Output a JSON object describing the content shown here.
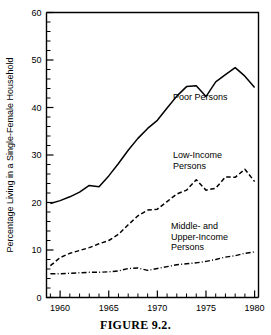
{
  "caption": "FIGURE 9.2.",
  "chart_data": {
    "type": "line",
    "title": "",
    "xlabel": "",
    "ylabel": "Percentage Living in a Single-Female Household",
    "xlim": [
      1958.6,
      1980.4
    ],
    "ylim": [
      0,
      60
    ],
    "ytick_labels": [
      "0",
      "10",
      "20",
      "30",
      "40",
      "50",
      "60"
    ],
    "ytick_values": [
      0,
      10,
      20,
      30,
      40,
      50,
      60
    ],
    "yminor_step": 2,
    "xtick_labels": [
      "1960",
      "1965",
      "1970",
      "1975",
      "1980"
    ],
    "xtick_values": [
      1960,
      1965,
      1970,
      1975,
      1980
    ],
    "xminor_step": 1,
    "grid": false,
    "legend_position": "inline-annotations",
    "x": [
      1959,
      1960,
      1961,
      1962,
      1963,
      1964,
      1965,
      1966,
      1967,
      1968,
      1969,
      1970,
      1971,
      1972,
      1973,
      1974,
      1975,
      1976,
      1977,
      1978,
      1979,
      1980
    ],
    "series": [
      {
        "name": "Poor Persons",
        "style": "solid",
        "label_x": 1971.6,
        "label_y": 41.5,
        "values": [
          19.8,
          20.4,
          21.2,
          22.2,
          23.6,
          23.3,
          25.6,
          28.2,
          31.0,
          33.5,
          35.6,
          37.3,
          39.9,
          42.4,
          44.4,
          44.6,
          42.3,
          45.4,
          46.9,
          48.4,
          46.6,
          44.2
        ]
      },
      {
        "name": "Low-Income Persons",
        "style": "dashed",
        "label_x": 1971.6,
        "label_y": 29.3,
        "label_line2_y": 26.6,
        "values": [
          6.7,
          8.4,
          9.3,
          9.9,
          10.5,
          11.3,
          12.0,
          13.3,
          15.3,
          17.2,
          18.4,
          18.6,
          20.2,
          21.8,
          22.6,
          24.8,
          22.6,
          23.0,
          25.4,
          25.3,
          27.0,
          24.4
        ]
      },
      {
        "name": "Middle- and Upper-Income Persons",
        "style": "dashdot",
        "label_x": 1971.4,
        "label_y": 14.4,
        "values": [
          5.0,
          5.0,
          5.1,
          5.2,
          5.3,
          5.3,
          5.4,
          5.6,
          6.1,
          6.2,
          5.7,
          6.1,
          6.5,
          6.9,
          7.1,
          7.3,
          7.6,
          8.0,
          8.5,
          8.8,
          9.3,
          9.6
        ]
      }
    ],
    "annotations": [
      {
        "id": "poor-persons-label",
        "lines": [
          "Poor Persons"
        ]
      },
      {
        "id": "low-income-label",
        "lines": [
          "Low-Income",
          "Persons"
        ]
      },
      {
        "id": "middle-upper-label",
        "lines": [
          "Middle- and",
          "Upper-Income",
          "Persons"
        ]
      }
    ]
  }
}
